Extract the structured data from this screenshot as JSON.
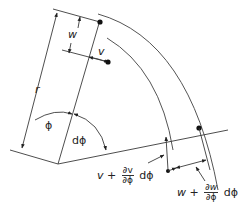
{
  "diagram": {
    "labels": {
      "r": "r",
      "w": "w",
      "v": "v",
      "phi": "ϕ",
      "dphi": "dϕ",
      "v_expr": {
        "base": "v +",
        "num": "∂v",
        "den": "∂ϕ",
        "tail": "dϕ"
      },
      "w_expr": {
        "base": "w +",
        "num": "∂w",
        "den": "∂ϕ",
        "tail": "dϕ"
      }
    },
    "colors": {
      "line": "#3a3a3a",
      "dot": "#111111"
    }
  }
}
